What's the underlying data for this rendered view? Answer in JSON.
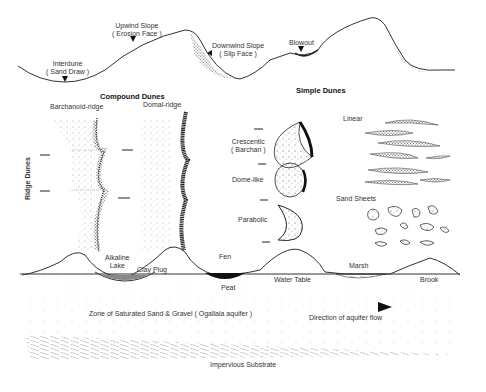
{
  "profile": {
    "upwind_slope": "Upwind Slope",
    "upwind_slope_sub": "( Erosion Face )",
    "downwind_slope": "Downwind  Slope",
    "downwind_slope_sub": "( Slip Face )",
    "interdune": "Interdune",
    "interdune_sub": "( Sand Draw )",
    "blowout": "Blowout"
  },
  "compound": {
    "title": "Compound Dunes",
    "barchanoid": "Barchanoid-ridge",
    "domal": "Domal-ridge",
    "ridge": "Ridge Dunes"
  },
  "simple": {
    "title": "Simple Dunes",
    "crescentic": "Crescentic",
    "crescentic_sub": "( Barchan )",
    "dome": "Dome-like",
    "parabolic": "Parabolic",
    "linear": "Linear",
    "sheets": "Sand Sheets"
  },
  "section": {
    "alkaline": "Alkaline",
    "lake": "Lake",
    "clay": "Clay Plug",
    "fen": "Fen",
    "peat": "Peat",
    "water_table": "Water Table",
    "marsh": "Marsh",
    "brook": "Brook",
    "aquifer": "Zone of Saturated Sand & Gravel  ( Ogallala aquifer )",
    "flow": "Direction of aquifer flow",
    "substrate": "Impervious Substrate"
  }
}
